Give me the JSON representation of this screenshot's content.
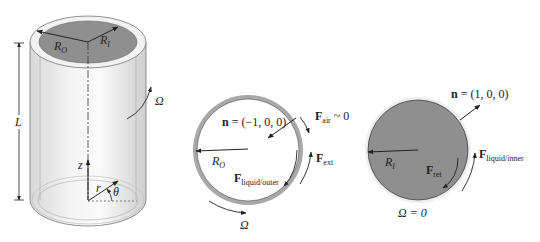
{
  "figure": {
    "cylinder": {
      "labels": {
        "outer_radius": "R",
        "outer_radius_sub": "O",
        "inner_radius": "R",
        "inner_radius_sub": "I",
        "length": "L",
        "angular_velocity": "Ω",
        "z_axis": "z",
        "radial": "r",
        "angle": "θ"
      }
    },
    "outer_panel": {
      "normal_bold": "n",
      "normal_value": " = (−1, 0, 0)",
      "f_air": "F",
      "f_air_sub": "air",
      "f_air_value": " ~ 0",
      "f_ext": "F",
      "f_ext_sub": "ext",
      "f_liquid": "F",
      "f_liquid_sub": "liquid/outer",
      "radius": "R",
      "radius_sub": "O",
      "omega": "Ω"
    },
    "inner_panel": {
      "normal_bold": "n",
      "normal_value": " = (1, 0, 0)",
      "f_liquid": "F",
      "f_liquid_sub": "liquid/inner",
      "f_ret": "F",
      "f_ret_sub": "ret",
      "radius": "R",
      "radius_sub": "I",
      "omega_label": "Ω = 0"
    },
    "colors": {
      "fill_gray": "#8f8f8f",
      "ring_gray": "#a8a8a8",
      "line": "#222222"
    }
  }
}
